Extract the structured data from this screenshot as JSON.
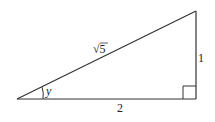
{
  "diagram": {
    "type": "right-triangle",
    "labels": {
      "hypotenuse": "√5",
      "hyp_sqrt": "√",
      "hyp_radicand": "5",
      "base": "2",
      "height": "1",
      "angle": "y"
    },
    "colors": {
      "stroke": "#333333",
      "background": "#ffffff"
    }
  }
}
